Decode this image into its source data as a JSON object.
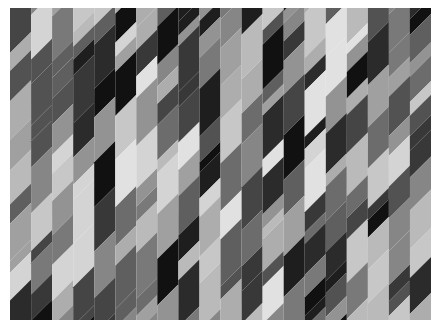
{
  "image": {
    "description": "Abstract grayscale composition of vertical columns cut into diagonal parallelogram segments",
    "background": "#ffffff",
    "pattern_area": {
      "x": 10,
      "y": 8,
      "width": 421,
      "height": 312
    },
    "columns": 20,
    "column_width": 21,
    "segment_slope": 1.0,
    "palette": [
      "#111111",
      "#1e1e1e",
      "#2b2b2b",
      "#383838",
      "#454545",
      "#525252",
      "#5f5f5f",
      "#6c6c6c",
      "#797979",
      "#868686",
      "#939393",
      "#a0a0a0",
      "#adadad",
      "#bababa",
      "#c7c7c7",
      "#d4d4d4",
      "#e1e1e1"
    ]
  }
}
